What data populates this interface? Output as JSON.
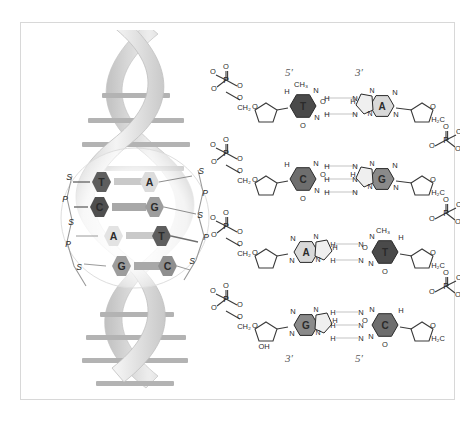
{
  "figure": {
    "background": "#ffffff",
    "frame_color": "#d8d8d8"
  },
  "helix": {
    "name": "dna-double-helix",
    "ribbon_color_light": "#e9e9e9",
    "ribbon_color_dark": "#c2c2c2",
    "rung_color": "#b0b0b0",
    "rung_count_top": 4,
    "rung_count_bottom": 4,
    "callout": {
      "name": "magnified-region",
      "base_pairs": [
        {
          "left": "T",
          "right": "A",
          "left_color": "#5e5e5e",
          "right_color": "#dcdcdc",
          "bond_color": "#c9c9c9"
        },
        {
          "left": "C",
          "right": "G",
          "left_color": "#4f4f4f",
          "right_color": "#9d9d9d",
          "bond_color": "#a8a8a8"
        },
        {
          "left": "A",
          "right": "T",
          "left_color": "#dcdcdc",
          "right_color": "#5e5e5e",
          "bond_color": "#c9c9c9"
        },
        {
          "left": "G",
          "right": "C",
          "left_color": "#9d9d9d",
          "right_color": "#8f8f8f",
          "bond_color": "#a8a8a8"
        }
      ],
      "backbone_left": [
        "S",
        "P",
        "S",
        "P",
        "S"
      ],
      "backbone_right": [
        "S",
        "P",
        "S",
        "P",
        "S"
      ],
      "backbone_label_sugar": "S",
      "backbone_label_phosphate": "P"
    }
  },
  "structure": {
    "name": "base-pair-chemical-structure",
    "top_labels": {
      "left": "5′",
      "right": "3′"
    },
    "bottom_labels": {
      "left": "3′",
      "right": "5′"
    },
    "atoms": {
      "phosphorus": "P",
      "oxygen": "O",
      "nitrogen": "N",
      "hydrogen": "H",
      "methyl": "CH₃",
      "methylene_left": "CH₂",
      "methylene_right": "H₂C",
      "hydroxyl": "OH"
    },
    "rows": [
      {
        "index": 1,
        "left_base": "T",
        "right_base": "A",
        "left_base_color": "#4a4a4a",
        "right_base_color": "#d9d9d9",
        "hydrogen_bonds": 2,
        "left_base_type": "pyrimidine",
        "right_base_type": "purine",
        "has_methyl": true
      },
      {
        "index": 2,
        "left_base": "C",
        "right_base": "G",
        "left_base_color": "#6e6e6e",
        "right_base_color": "#8a8a8a",
        "hydrogen_bonds": 3,
        "left_base_type": "pyrimidine",
        "right_base_type": "purine",
        "has_methyl": false
      },
      {
        "index": 3,
        "left_base": "A",
        "right_base": "T",
        "left_base_color": "#d9d9d9",
        "right_base_color": "#4a4a4a",
        "hydrogen_bonds": 2,
        "left_base_type": "purine",
        "right_base_type": "pyrimidine",
        "has_methyl": true
      },
      {
        "index": 4,
        "left_base": "G",
        "right_base": "C",
        "left_base_color": "#8a8a8a",
        "right_base_color": "#6e6e6e",
        "hydrogen_bonds": 3,
        "left_base_type": "purine",
        "right_base_type": "pyrimidine",
        "has_methyl": false
      }
    ]
  }
}
